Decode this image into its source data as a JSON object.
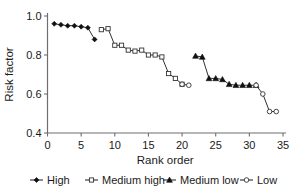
{
  "chart_data": {
    "type": "line",
    "title": "",
    "xlabel": "Rank order",
    "ylabel": "Risk factor",
    "xlim": [
      0,
      35
    ],
    "ylim": [
      0.4,
      1.0
    ],
    "xticks": [
      0,
      5,
      10,
      15,
      20,
      25,
      30,
      35
    ],
    "yticks": [
      0.4,
      0.6,
      0.8,
      1.0
    ],
    "xtick_labels": [
      "0",
      "5",
      "10",
      "15",
      "20",
      "25",
      "30",
      "35"
    ],
    "ytick_labels": [
      "0.4",
      "0.6",
      "0.8",
      "1.0"
    ],
    "grid": false,
    "legend_position": "below",
    "series": [
      {
        "name": "High",
        "marker": "filled-diamond",
        "x": [
          1,
          2,
          3,
          4,
          5,
          6,
          7
        ],
        "values": [
          0.96,
          0.955,
          0.95,
          0.95,
          0.945,
          0.94,
          0.88
        ]
      },
      {
        "name": "Medium high",
        "marker": "open-square",
        "x": [
          8,
          9,
          10,
          11,
          12,
          13,
          14,
          15,
          16,
          17,
          18,
          19,
          20
        ],
        "values": [
          0.93,
          0.935,
          0.85,
          0.85,
          0.825,
          0.82,
          0.825,
          0.8,
          0.8,
          0.79,
          0.705,
          0.68,
          0.65
        ]
      },
      {
        "name": "Medium low",
        "marker": "filled-triangle",
        "x": [
          22,
          23,
          24,
          25,
          26,
          27,
          28,
          29,
          30,
          31
        ],
        "values": [
          0.795,
          0.79,
          0.68,
          0.68,
          0.675,
          0.65,
          0.645,
          0.645,
          0.645,
          0.645
        ]
      },
      {
        "name": "Low",
        "marker": "open-circle",
        "x": [
          20,
          21,
          31,
          32,
          33,
          34
        ],
        "values": [
          0.65,
          0.645,
          0.645,
          0.6,
          0.51,
          0.51
        ]
      }
    ]
  },
  "legend": {
    "items": [
      {
        "label": "High",
        "marker": "filled-diamond"
      },
      {
        "label": "Medium high",
        "marker": "open-square"
      },
      {
        "label": "Medium low",
        "marker": "filled-triangle"
      },
      {
        "label": "Low",
        "marker": "open-circle"
      }
    ]
  },
  "colors": {
    "marker_fill": "#111111",
    "marker_open_fill": "#ffffff",
    "line": "#1a1a1a",
    "axis": "#6e6e6e",
    "background": "#ffffff"
  }
}
